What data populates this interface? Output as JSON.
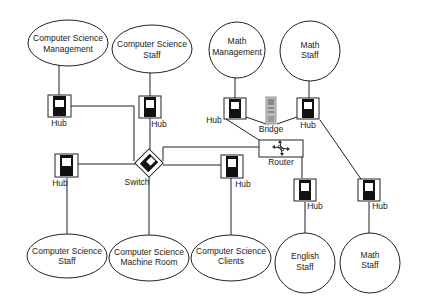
{
  "diagram": {
    "type": "network-topology",
    "nodes": [
      {
        "id": "cs_mgmt",
        "kind": "group",
        "lines": [
          "Computer Science",
          "Management"
        ]
      },
      {
        "id": "cs_staff_top",
        "kind": "group",
        "lines": [
          "Computer Science",
          "Staff"
        ]
      },
      {
        "id": "math_mgmt",
        "kind": "group",
        "lines": [
          "Math",
          "Management"
        ]
      },
      {
        "id": "math_staff_top",
        "kind": "group",
        "lines": [
          "Math",
          "Staff"
        ]
      },
      {
        "id": "cs_staff_bottom",
        "kind": "group",
        "lines": [
          "Computer Science",
          "Staff"
        ]
      },
      {
        "id": "cs_machine_room",
        "kind": "group",
        "lines": [
          "Computer Science",
          "Machine Room"
        ]
      },
      {
        "id": "cs_clients",
        "kind": "group",
        "lines": [
          "Computer Science",
          "Clients"
        ]
      },
      {
        "id": "english_staff",
        "kind": "group",
        "lines": [
          "English",
          "Staff"
        ]
      },
      {
        "id": "math_staff_bottom",
        "kind": "group",
        "lines": [
          "Math",
          "Staff"
        ]
      }
    ],
    "devices": {
      "hub_label": "Hub",
      "switch_label": "Switch",
      "router_label": "Router",
      "bridge_label": "Bridge"
    },
    "edges": [
      [
        "cs_mgmt",
        "hub_cs_mgmt"
      ],
      [
        "cs_staff_top",
        "hub_cs_staff_top"
      ],
      [
        "math_mgmt",
        "hub_math_mgmt"
      ],
      [
        "math_staff_top",
        "hub_math_staff_top"
      ],
      [
        "hub_cs_mgmt",
        "switch"
      ],
      [
        "hub_cs_staff_top",
        "switch"
      ],
      [
        "hub_cs_staff_bottom",
        "switch"
      ],
      [
        "switch",
        "cs_machine_room"
      ],
      [
        "switch",
        "hub_cs_clients"
      ],
      [
        "switch",
        "router"
      ],
      [
        "hub_math_mgmt",
        "bridge"
      ],
      [
        "bridge",
        "hub_math_staff_top"
      ],
      [
        "hub_math_mgmt",
        "router"
      ],
      [
        "router",
        "hub_english"
      ],
      [
        "hub_math_staff_top",
        "hub_math_staff_bottom"
      ],
      [
        "hub_cs_staff_bottom",
        "cs_staff_bottom"
      ],
      [
        "hub_cs_clients",
        "cs_clients"
      ],
      [
        "hub_english",
        "english_staff"
      ],
      [
        "hub_math_staff_bottom",
        "math_staff_bottom"
      ]
    ]
  }
}
